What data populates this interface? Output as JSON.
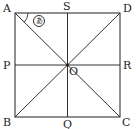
{
  "figure": {
    "points": {
      "A": {
        "label": "A",
        "x": 15,
        "y": 13
      },
      "D": {
        "label": "D",
        "x": 120,
        "y": 13
      },
      "B": {
        "label": "B",
        "x": 15,
        "y": 117
      },
      "C": {
        "label": "C",
        "x": 120,
        "y": 117
      },
      "S": {
        "label": "S",
        "x": 67.5,
        "y": 13
      },
      "P": {
        "label": "P",
        "x": 15,
        "y": 65
      },
      "R": {
        "label": "R",
        "x": 120,
        "y": 65
      },
      "Q": {
        "label": "Q",
        "x": 67.5,
        "y": 117
      },
      "O": {
        "label": "O",
        "x": 67.5,
        "y": 65
      }
    },
    "angle_marker": {
      "label": "あ",
      "vertex": "A",
      "between": [
        "S",
        "O"
      ]
    },
    "colors": {
      "line": "#333333",
      "text": "#222222",
      "background": "#ffffff"
    }
  }
}
